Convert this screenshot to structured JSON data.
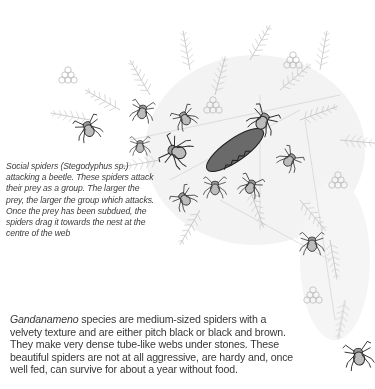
{
  "illustration": {
    "description": "Pencil drawing of social spiders attacking a beetle on a branching web/fern structure",
    "icon": "spider-web-illustration",
    "colors": {
      "ink": "#2a2a2a",
      "web": "#b5b5b5",
      "background": "#ffffff"
    }
  },
  "caption": {
    "text": "Social spiders (Stegodyphus sp.) attacking a beetle. These spiders attack their prey as a group. The larger the prey, the larger the group which attacks. Once the prey has been subdued, the spiders drag it towards the nest at the centre of the web"
  },
  "body": {
    "species_name": "Gandanameno",
    "text": " species are medium-sized spiders with a velvety texture and are either pitch black or black and brown. They make very dense tube-like webs under stones. These beautiful spiders are not at all aggressive, are hardy and, once well fed, can survive for about a year without food."
  }
}
